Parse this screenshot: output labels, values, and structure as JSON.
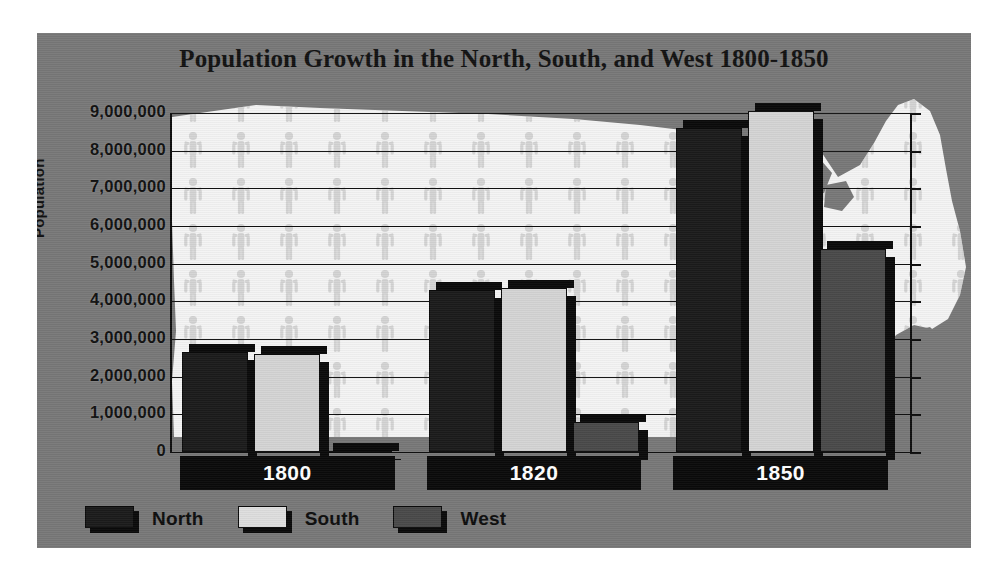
{
  "chart_data": {
    "type": "bar",
    "title": "Population Growth in the North, South, and West 1800-1850",
    "xlabel": "",
    "ylabel": "Population",
    "categories": [
      "1800",
      "1820",
      "1850"
    ],
    "series": [
      {
        "name": "North",
        "color": "#1b1b1b",
        "values": [
          2650000,
          4300000,
          8600000
        ]
      },
      {
        "name": "South",
        "color": "#d4d4d4",
        "values": [
          2600000,
          4350000,
          9050000
        ]
      },
      {
        "name": "West",
        "color": "#4a4a4a",
        "values": [
          30000,
          800000,
          5400000
        ]
      }
    ],
    "ylim": [
      0,
      9000000
    ],
    "ytick_labels": [
      "9,000,000",
      "8,000,000",
      "7,000,000",
      "6,000,000",
      "5,000,000",
      "4,000,000",
      "3,000,000",
      "2,000,000",
      "1,000,000",
      "0"
    ],
    "ytick_values": [
      9000000,
      8000000,
      7000000,
      6000000,
      5000000,
      4000000,
      3000000,
      2000000,
      1000000,
      0
    ],
    "grid": true,
    "legend_position": "bottom-left",
    "background_image": "united-states-map-silhouette-with-people-icons"
  },
  "legend": {
    "items": [
      {
        "label": "North",
        "swatch": "north-swatch"
      },
      {
        "label": "South",
        "swatch": "south-swatch"
      },
      {
        "label": "West",
        "swatch": "west-swatch"
      }
    ]
  },
  "colors": {
    "panel_background": "#787878",
    "page_background": "#ffffff",
    "north": "#1b1b1b",
    "south": "#d4d4d4",
    "west": "#4a4a4a",
    "axis": "#0d0d0d",
    "category_band": "#0a0a0a",
    "category_text": "#ffffff",
    "map_fill": "#f2f2f2"
  }
}
